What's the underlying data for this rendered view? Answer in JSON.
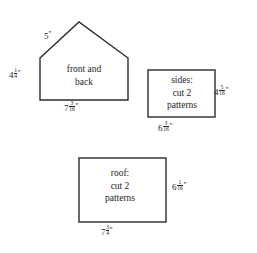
{
  "diagram": {
    "background_color": "#ffffff",
    "line_color": "#2b2b2b",
    "text_color": "#262626",
    "shapes": [
      {
        "id": "front-and-back",
        "type": "pentagon-house",
        "inner_label_lines": [
          "front and",
          "back"
        ],
        "dimensions": {
          "roof_slope": {
            "whole": "5",
            "num": "",
            "den": "",
            "unit": "\""
          },
          "left_side": {
            "whole": "4",
            "num": "1",
            "den": "4",
            "unit": "\""
          },
          "bottom": {
            "whole": "7",
            "num": "3",
            "den": "16",
            "unit": "\""
          }
        }
      },
      {
        "id": "sides",
        "type": "rectangle",
        "inner_label_lines": [
          "sides:",
          "cut 2",
          "patterns"
        ],
        "dimensions": {
          "right_side": {
            "whole": "4",
            "num": "5",
            "den": "16",
            "unit": "\""
          },
          "bottom": {
            "whole": "6",
            "num": "3",
            "den": "16",
            "unit": "\""
          }
        }
      },
      {
        "id": "roof",
        "type": "rectangle",
        "inner_label_lines": [
          "roof:",
          "cut 2",
          "patterns"
        ],
        "dimensions": {
          "right_side": {
            "whole": "6",
            "num": "1",
            "den": "16",
            "unit": "\""
          },
          "bottom": {
            "whole": "7",
            "num": "3",
            "den": "4",
            "unit": "\""
          }
        }
      }
    ],
    "text": {
      "house_inner_line1": "front and",
      "house_inner_line2": "back",
      "house_roof_whole": "5",
      "house_roof_unit": "\"",
      "house_left_whole": "4",
      "house_left_num": "1",
      "house_left_den": "4",
      "house_left_unit": "\"",
      "house_bottom_whole": "7",
      "house_bottom_num": "3",
      "house_bottom_den": "16",
      "house_bottom_unit": "\"",
      "sides_inner_line1": "sides:",
      "sides_inner_line2": "cut 2",
      "sides_inner_line3": "patterns",
      "sides_right_whole": "4",
      "sides_right_num": "5",
      "sides_right_den": "16",
      "sides_right_unit": "\"",
      "sides_bottom_whole": "6",
      "sides_bottom_num": "3",
      "sides_bottom_den": "16",
      "sides_bottom_unit": "\"",
      "roof_inner_line1": "roof:",
      "roof_inner_line2": "cut 2",
      "roof_inner_line3": "patterns",
      "roof_right_whole": "6",
      "roof_right_num": "1",
      "roof_right_den": "16",
      "roof_right_unit": "\"",
      "roof_bottom_whole": "7",
      "roof_bottom_num": "3",
      "roof_bottom_den": "4",
      "roof_bottom_unit": "\""
    }
  }
}
